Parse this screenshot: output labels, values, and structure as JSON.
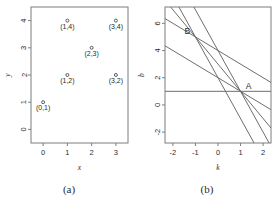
{
  "figure": {
    "panels": [
      {
        "caption": "(a)"
      },
      {
        "caption": "(b)"
      }
    ]
  },
  "chart_data": [
    {
      "type": "scatter",
      "panel": "(a)",
      "title": "",
      "xlabel": "x",
      "ylabel": "y",
      "xlim": [
        -0.5,
        3.5
      ],
      "ylim": [
        -0.5,
        4.5
      ],
      "xticks": [
        0,
        1,
        2,
        3
      ],
      "xticklabels": [
        "0",
        "1",
        "2",
        "3"
      ],
      "yticks": [
        0,
        1,
        2,
        3,
        4
      ],
      "yticklabels": [
        "0",
        "1",
        "2",
        "3",
        "4"
      ],
      "grid": false,
      "legend": "none",
      "points": [
        {
          "x": 0,
          "y": 1,
          "label": "(0,1)"
        },
        {
          "x": 1,
          "y": 2,
          "label": "(1,2)"
        },
        {
          "x": 1,
          "y": 4,
          "label": "(1,4)"
        },
        {
          "x": 2,
          "y": 3,
          "label": "(2,3)"
        },
        {
          "x": 3,
          "y": 2,
          "label": "(3,2)"
        },
        {
          "x": 3,
          "y": 4,
          "label": "(3,4)"
        }
      ]
    },
    {
      "type": "line",
      "panel": "(b)",
      "title": "",
      "xlabel": "k",
      "ylabel": "b",
      "xlim": [
        -2.35,
        2.35
      ],
      "ylim": [
        -2.8,
        7.2
      ],
      "xticks": [
        -2,
        -1,
        0,
        1,
        2
      ],
      "xticklabels": [
        "-2",
        "-1",
        "0",
        "1",
        "2"
      ],
      "yticks": [
        -2,
        0,
        2,
        4,
        6
      ],
      "yticklabels": [
        "-2",
        "0",
        "2",
        "4",
        "6"
      ],
      "grid": false,
      "legend": "none",
      "series": [
        {
          "name": "b = 1 - 0k",
          "slope": 0,
          "intercept": 1
        },
        {
          "name": "b = 2 - 1k",
          "slope": -1,
          "intercept": 2
        },
        {
          "name": "b = 4 - 1k",
          "slope": -1,
          "intercept": 4
        },
        {
          "name": "b = 3 - 2k",
          "slope": -2,
          "intercept": 3
        },
        {
          "name": "b = 2 - 3k",
          "slope": -3,
          "intercept": 2
        },
        {
          "name": "b = 4 - 3k",
          "slope": -3,
          "intercept": 4
        }
      ],
      "annotations": [
        {
          "label": "A",
          "k": 1,
          "b": 1
        },
        {
          "label": "B",
          "k": -1,
          "b": 5
        }
      ]
    }
  ]
}
